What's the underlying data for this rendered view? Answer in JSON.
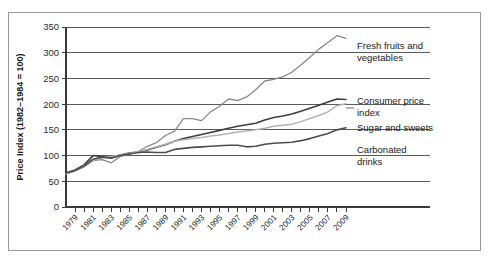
{
  "chart_data": {
    "type": "line",
    "title": "",
    "xlabel": "",
    "ylabel": "Price Index (1982–1984 = 100)",
    "ylim": [
      0,
      350
    ],
    "xlim": [
      1978,
      2009
    ],
    "ytick_values": [
      0,
      50,
      100,
      150,
      200,
      250,
      300,
      350
    ],
    "ytick_labels": [
      "0",
      "50",
      "100",
      "150",
      "200",
      "250",
      "300",
      "350"
    ],
    "xtick_labels": [
      "1979",
      "1981",
      "1983",
      "1985",
      "1987",
      "1989",
      "1991",
      "1993",
      "1995",
      "1997",
      "1999",
      "2001",
      "2003",
      "2005",
      "2007",
      "2009"
    ],
    "xtick_values": [
      1979,
      1981,
      1983,
      1985,
      1987,
      1989,
      1991,
      1993,
      1995,
      1997,
      1999,
      2001,
      2003,
      2005,
      2007,
      2009
    ],
    "xtick_label_rotation": -45,
    "minor_ticks_every": 1,
    "grid": "horizontal",
    "legend_position": "right-inline-labels",
    "x": [
      1978,
      1979,
      1980,
      1981,
      1982,
      1983,
      1984,
      1985,
      1986,
      1987,
      1988,
      1989,
      1990,
      1991,
      1992,
      1993,
      1994,
      1995,
      1996,
      1997,
      1998,
      1999,
      2000,
      2001,
      2002,
      2003,
      2004,
      2005,
      2006,
      2007,
      2008,
      2009
    ],
    "series": [
      {
        "name": "Fresh fruits and vegetables",
        "color": "#8a8a8a",
        "width": 1.3,
        "values": [
          65,
          70,
          78,
          90,
          92,
          86,
          98,
          103,
          108,
          118,
          125,
          139,
          147,
          172,
          172,
          168,
          185,
          196,
          210,
          207,
          214,
          228,
          245,
          248,
          253,
          262,
          276,
          291,
          307,
          320,
          333,
          328
        ]
      },
      {
        "name": "Consumer price index",
        "color": "#3d3d3d",
        "width": 1.6,
        "values": [
          66,
          72,
          82,
          100,
          98,
          96,
          101,
          105,
          107,
          111,
          116,
          121,
          128,
          133,
          137,
          141,
          145,
          149,
          153,
          157,
          160,
          163,
          169,
          174,
          177,
          181,
          186,
          192,
          198,
          204,
          210,
          209
        ]
      },
      {
        "name": "Sugar and sweets",
        "color": "#b4b4b4",
        "width": 1.5,
        "values": [
          64,
          70,
          80,
          91,
          96,
          98,
          101,
          104,
          108,
          112,
          117,
          122,
          128,
          131,
          133,
          135,
          138,
          140,
          143,
          146,
          148,
          150,
          153,
          157,
          159,
          161,
          166,
          172,
          178,
          185,
          197,
          201
        ]
      },
      {
        "name": "Carbonated drinks",
        "color": "#4d4d4d",
        "width": 1.6,
        "values": [
          66,
          71,
          80,
          93,
          97,
          95,
          100,
          103,
          106,
          107,
          106,
          106,
          112,
          114,
          116,
          117,
          118,
          119,
          120,
          120,
          117,
          118,
          122,
          124,
          125,
          126,
          129,
          133,
          138,
          143,
          150,
          154
        ]
      }
    ],
    "series_labels": [
      {
        "text_line1": "Fresh fruits and",
        "text_line2": "vegetables"
      },
      {
        "text_line1": "Consumer price",
        "text_line2": "index"
      },
      {
        "text_line1": "Sugar and sweets",
        "text_line2": ""
      },
      {
        "text_line1": "Carbonated",
        "text_line2": "drinks"
      }
    ]
  }
}
